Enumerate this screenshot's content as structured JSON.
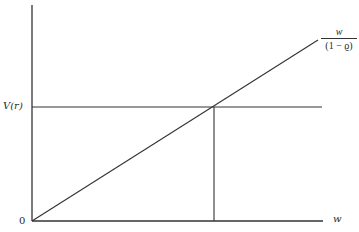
{
  "diagram": {
    "y_axis_tick_label": "V(r)",
    "origin_label": "0",
    "x_axis_label": "w",
    "line_label": {
      "numerator": "w",
      "denominator": "(1 − ϱ)"
    },
    "line_color": "#333333"
  }
}
